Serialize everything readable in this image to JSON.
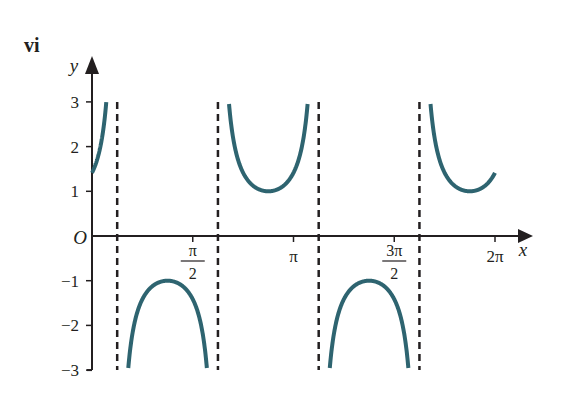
{
  "part_label": "vi",
  "chart_data": {
    "type": "line",
    "title": "",
    "function": "y = sec(2x + π/4)",
    "xlabel": "x",
    "ylabel": "y",
    "origin_label": "O",
    "xlim": [
      0,
      6.2832
    ],
    "ylim": [
      -3,
      3
    ],
    "x_ticks": [
      {
        "value": 1.5708,
        "label_num": "π",
        "label_den": "2"
      },
      {
        "value": 3.1416,
        "label": "π"
      },
      {
        "value": 4.7124,
        "label_num": "3π",
        "label_den": "2"
      },
      {
        "value": 6.2832,
        "label": "2π"
      }
    ],
    "y_ticks": [
      {
        "value": 3,
        "label": "3"
      },
      {
        "value": 2,
        "label": "2"
      },
      {
        "value": 1,
        "label": "1"
      },
      {
        "value": -1,
        "label": "−1"
      },
      {
        "value": -2,
        "label": "−2"
      },
      {
        "value": -3,
        "label": "−3"
      }
    ],
    "asymptotes_x": [
      0.3927,
      1.9635,
      3.5343,
      5.1051
    ],
    "key_points": [
      {
        "x": 0,
        "y": 1.414
      },
      {
        "x": 1.1781,
        "y": -1
      },
      {
        "x": 2.7489,
        "y": 1
      },
      {
        "x": 4.3197,
        "y": -1
      },
      {
        "x": 5.8905,
        "y": 1
      },
      {
        "x": 6.2832,
        "y": 1.414
      }
    ],
    "grid": false,
    "legend": null
  },
  "colors": {
    "curve": "#2e6470",
    "axis": "#231f20"
  }
}
